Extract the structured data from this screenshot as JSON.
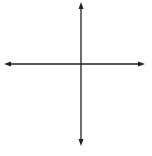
{
  "diagram": {
    "type": "coordinate-plane",
    "grid": {
      "x_min": -5,
      "x_max": 4,
      "y_min": -5,
      "y_max": 4,
      "unit_px": 15.3,
      "origin_px": [
        81,
        64
      ],
      "color": "#c8c8c8"
    },
    "axes": {
      "x_label": "x",
      "y_label": "y",
      "color": "#222222"
    },
    "tick_labels": [
      {
        "axis": "x",
        "value": 1,
        "text": "1"
      },
      {
        "axis": "y",
        "value": 2,
        "text": "2"
      }
    ],
    "polygon": {
      "name": "QRST",
      "stroke": "#555555",
      "vertices": [
        {
          "label": "Q",
          "x": 1,
          "y": 2
        },
        {
          "label": "R",
          "x": 2,
          "y": 0
        },
        {
          "label": "S",
          "x": 1,
          "y": -3
        },
        {
          "label": "T",
          "x": -4,
          "y": 0
        }
      ]
    }
  }
}
